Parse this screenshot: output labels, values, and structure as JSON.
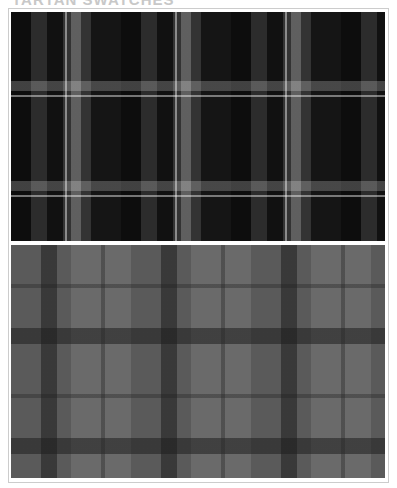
{
  "header": {
    "title_partial": "TARTAN SWATCHES"
  },
  "swatches": [
    {
      "label": "Dark tartan (black / grey / white check)",
      "colors": [
        "#0d0d0d",
        "#2c2c2c",
        "#8a8a8a",
        "#d0d0d0"
      ]
    },
    {
      "label": "Grey tartan (mid grey / charcoal check)",
      "colors": [
        "#5a5a5a",
        "#6a6a6a",
        "#2e2e2e"
      ]
    }
  ]
}
